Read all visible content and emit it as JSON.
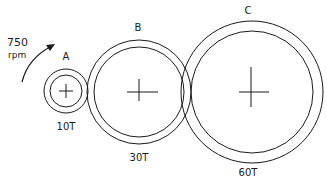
{
  "input": {
    "speed_value": "750",
    "speed_unit": "rpm"
  },
  "gears": [
    {
      "name": "A",
      "teeth": "10T"
    },
    {
      "name": "B",
      "teeth": "30T"
    },
    {
      "name": "C",
      "teeth": "60T"
    }
  ],
  "colors": {
    "stroke": "#1a1a1a",
    "background": "#ffffff"
  }
}
